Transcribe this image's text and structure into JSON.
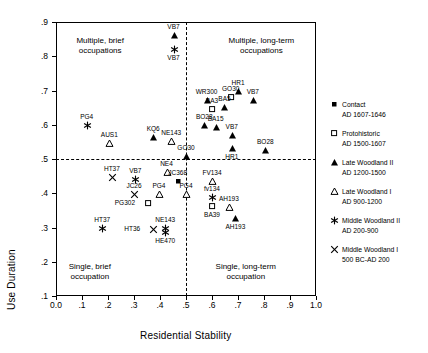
{
  "chart_data": {
    "type": "scatter",
    "title": "",
    "xlabel": "Residential Stability",
    "ylabel": "Use Duration",
    "xlim": [
      0.0,
      1.0
    ],
    "ylim": [
      0.1,
      0.9
    ],
    "xticks": [
      "0.0",
      ".1",
      ".2",
      ".3",
      ".4",
      ".5",
      ".6",
      ".7",
      ".8",
      ".9",
      "1.0"
    ],
    "xtick_values": [
      0.0,
      0.1,
      0.2,
      0.3,
      0.4,
      0.5,
      0.6,
      0.7,
      0.8,
      0.9,
      1.0
    ],
    "yticks": [
      ".1",
      ".2",
      ".3",
      ".4",
      ".5",
      ".6",
      ".7",
      ".8",
      ".9"
    ],
    "ytick_values": [
      0.1,
      0.2,
      0.3,
      0.4,
      0.5,
      0.6,
      0.7,
      0.8,
      0.9
    ],
    "grid": false,
    "reference_lines": {
      "vertical_x": 0.5,
      "horizontal_y": 0.5,
      "style": "dashed"
    },
    "legend_position": "right-outside",
    "quadrant_labels": [
      {
        "name": "upper-left",
        "line1": "Multiple, brief",
        "line2": "occupations",
        "x": 0.17,
        "y": 0.845
      },
      {
        "name": "upper-right",
        "line1": "Multiple, long-term",
        "line2": "occupations",
        "x": 0.79,
        "y": 0.845
      },
      {
        "name": "lower-left",
        "line1": "Single, brief",
        "line2": "occupation",
        "x": 0.13,
        "y": 0.185
      },
      {
        "name": "lower-right",
        "line1": "Single, long-term",
        "line2": "occupation",
        "x": 0.73,
        "y": 0.185
      }
    ],
    "series": [
      {
        "name": "Contact",
        "period": "AD 1607-1646",
        "marker": "filled-square"
      },
      {
        "name": "Protohistoric",
        "period": "AD 1500-1607",
        "marker": "open-square"
      },
      {
        "name": "Late Woodland II",
        "period": "AD 1200-1500",
        "marker": "filled-triangle"
      },
      {
        "name": "Late Woodland I",
        "period": "AD 900-1200",
        "marker": "open-triangle"
      },
      {
        "name": "Middle Woodland II",
        "period": "AD 200-900",
        "marker": "asterisk"
      },
      {
        "name": "Middle Woodland I",
        "period": "500 BC-AD 200",
        "marker": "cross"
      }
    ],
    "points": [
      {
        "label": "VB7",
        "x": 0.452,
        "y": 0.862,
        "marker": "filled-triangle",
        "label_pos": "above"
      },
      {
        "label": "VB7",
        "x": 0.452,
        "y": 0.822,
        "marker": "asterisk",
        "label_pos": "below"
      },
      {
        "label": "PG4",
        "x": 0.118,
        "y": 0.6,
        "marker": "asterisk",
        "label_pos": "above"
      },
      {
        "label": "AUS1",
        "x": 0.205,
        "y": 0.548,
        "marker": "open-triangle",
        "label_pos": "above"
      },
      {
        "label": "KQ6",
        "x": 0.374,
        "y": 0.565,
        "marker": "filled-triangle",
        "label_pos": "above"
      },
      {
        "label": "NE143",
        "x": 0.443,
        "y": 0.553,
        "marker": "open-triangle",
        "label_pos": "above"
      },
      {
        "label": "WR300",
        "x": 0.579,
        "y": 0.672,
        "marker": "filled-triangle",
        "label_pos": "above"
      },
      {
        "label": "BA3",
        "x": 0.6,
        "y": 0.645,
        "marker": "open-square",
        "label_pos": "above"
      },
      {
        "label": "GO30",
        "x": 0.672,
        "y": 0.682,
        "marker": "open-square",
        "label_pos": "above"
      },
      {
        "label": "HR1",
        "x": 0.7,
        "y": 0.7,
        "marker": "filled-triangle",
        "label_pos": "above"
      },
      {
        "label": "VB7",
        "x": 0.757,
        "y": 0.672,
        "marker": "filled-triangle",
        "label_pos": "above"
      },
      {
        "label": "BA5",
        "x": 0.648,
        "y": 0.653,
        "marker": "filled-triangle",
        "label_pos": "above"
      },
      {
        "label": "BO28",
        "x": 0.57,
        "y": 0.6,
        "marker": "filled-triangle",
        "label_pos": "above"
      },
      {
        "label": "BA15",
        "x": 0.614,
        "y": 0.592,
        "marker": "filled-triangle",
        "label_pos": "above"
      },
      {
        "label": "VB7",
        "x": 0.676,
        "y": 0.57,
        "marker": "filled-triangle",
        "label_pos": "above"
      },
      {
        "label": "HR1",
        "x": 0.676,
        "y": 0.533,
        "marker": "filled-triangle",
        "label_pos": "below"
      },
      {
        "label": "BO28",
        "x": 0.805,
        "y": 0.525,
        "marker": "filled-triangle",
        "label_pos": "above"
      },
      {
        "label": "GO30",
        "x": 0.5,
        "y": 0.508,
        "marker": "filled-triangle",
        "label_pos": "above"
      },
      {
        "label": "NE4",
        "x": 0.425,
        "y": 0.462,
        "marker": "open-triangle",
        "label_pos": "above"
      },
      {
        "label": "HT37",
        "x": 0.215,
        "y": 0.448,
        "marker": "cross",
        "label_pos": "above"
      },
      {
        "label": "VB7",
        "x": 0.305,
        "y": 0.443,
        "marker": "asterisk",
        "label_pos": "above"
      },
      {
        "label": "JC368",
        "x": 0.468,
        "y": 0.435,
        "marker": "filled-square",
        "label_pos": "above"
      },
      {
        "label": "JC26",
        "x": 0.3,
        "y": 0.398,
        "marker": "cross",
        "label_pos": "above"
      },
      {
        "label": "PG4",
        "x": 0.396,
        "y": 0.398,
        "marker": "open-triangle",
        "label_pos": "above"
      },
      {
        "label": "PG4",
        "x": 0.5,
        "y": 0.398,
        "marker": "open-triangle",
        "label_pos": "above"
      },
      {
        "label": "PG302",
        "x": 0.354,
        "y": 0.372,
        "marker": "open-square",
        "label_pos": "left"
      },
      {
        "label": "FV134",
        "x": 0.6,
        "y": 0.435,
        "marker": "open-triangle",
        "label_pos": "above"
      },
      {
        "label": "fv134",
        "x": 0.6,
        "y": 0.39,
        "marker": "asterisk",
        "label_pos": "above"
      },
      {
        "label": "BA39",
        "x": 0.6,
        "y": 0.362,
        "marker": "open-square",
        "label_pos": "below"
      },
      {
        "label": "AH193",
        "x": 0.665,
        "y": 0.36,
        "marker": "open-triangle",
        "label_pos": "above"
      },
      {
        "label": "AH193",
        "x": 0.69,
        "y": 0.328,
        "marker": "filled-triangle",
        "label_pos": "below"
      },
      {
        "label": "HT37",
        "x": 0.178,
        "y": 0.3,
        "marker": "asterisk",
        "label_pos": "above"
      },
      {
        "label": "HT36",
        "x": 0.374,
        "y": 0.295,
        "marker": "cross",
        "label_pos": "left"
      },
      {
        "label": "NE143",
        "x": 0.42,
        "y": 0.3,
        "marker": "asterisk",
        "label_pos": "above"
      },
      {
        "label": "HE470",
        "x": 0.42,
        "y": 0.288,
        "marker": "asterisk",
        "label_pos": "below"
      }
    ]
  },
  "legend": {
    "items": [
      {
        "label": "Contact",
        "sublabel": "AD 1607-1646",
        "marker": "filled-square"
      },
      {
        "label": "Protohistoric",
        "sublabel": "AD 1500-1607",
        "marker": "open-square"
      },
      {
        "label": "Late Woodland II",
        "sublabel": "AD 1200-1500",
        "marker": "filled-triangle"
      },
      {
        "label": "Late Woodland I",
        "sublabel": "AD 900-1200",
        "marker": "open-triangle"
      },
      {
        "label": "Middle Woodland II",
        "sublabel": "AD 200-900",
        "marker": "asterisk"
      },
      {
        "label": "Middle Woodland I",
        "sublabel": "500 BC-AD 200",
        "marker": "cross"
      }
    ]
  },
  "colors": {
    "axis": "#000000",
    "marker": "#000000",
    "background": "#ffffff"
  }
}
